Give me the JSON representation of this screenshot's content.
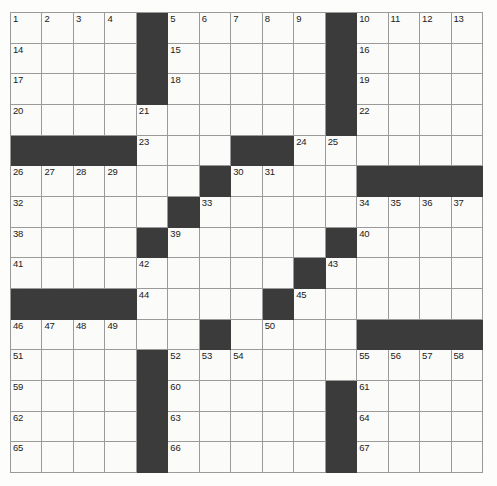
{
  "puzzle": {
    "title": "Crossword Grid",
    "size": {
      "rows": 15,
      "cols": 15
    },
    "colors": {
      "block": "#3b3b3b",
      "cell": "#fbfbf9",
      "gridline": "#9a9a9a",
      "number": "#1a1a1a",
      "page_background": "#fdfdfb"
    },
    "clue_number_count": 67,
    "block_count": 70,
    "grid": [
      [
        {
          "type": "open",
          "number": "1"
        },
        {
          "type": "open",
          "number": "2"
        },
        {
          "type": "open",
          "number": "3"
        },
        {
          "type": "open",
          "number": "4"
        },
        {
          "type": "block",
          "number": ""
        },
        {
          "type": "open",
          "number": "5"
        },
        {
          "type": "open",
          "number": "6"
        },
        {
          "type": "open",
          "number": "7"
        },
        {
          "type": "open",
          "number": "8"
        },
        {
          "type": "open",
          "number": "9"
        },
        {
          "type": "block",
          "number": ""
        },
        {
          "type": "open",
          "number": "10"
        },
        {
          "type": "open",
          "number": "11"
        },
        {
          "type": "open",
          "number": "12"
        },
        {
          "type": "open",
          "number": "13"
        }
      ],
      [
        {
          "type": "open",
          "number": "14"
        },
        {
          "type": "open",
          "number": ""
        },
        {
          "type": "open",
          "number": ""
        },
        {
          "type": "open",
          "number": ""
        },
        {
          "type": "block",
          "number": ""
        },
        {
          "type": "open",
          "number": "15"
        },
        {
          "type": "open",
          "number": ""
        },
        {
          "type": "open",
          "number": ""
        },
        {
          "type": "open",
          "number": ""
        },
        {
          "type": "open",
          "number": ""
        },
        {
          "type": "block",
          "number": ""
        },
        {
          "type": "open",
          "number": "16"
        },
        {
          "type": "open",
          "number": ""
        },
        {
          "type": "open",
          "number": ""
        },
        {
          "type": "open",
          "number": ""
        }
      ],
      [
        {
          "type": "open",
          "number": "17"
        },
        {
          "type": "open",
          "number": ""
        },
        {
          "type": "open",
          "number": ""
        },
        {
          "type": "open",
          "number": ""
        },
        {
          "type": "block",
          "number": ""
        },
        {
          "type": "open",
          "number": "18"
        },
        {
          "type": "open",
          "number": ""
        },
        {
          "type": "open",
          "number": ""
        },
        {
          "type": "open",
          "number": ""
        },
        {
          "type": "open",
          "number": ""
        },
        {
          "type": "block",
          "number": ""
        },
        {
          "type": "open",
          "number": "19"
        },
        {
          "type": "open",
          "number": ""
        },
        {
          "type": "open",
          "number": ""
        },
        {
          "type": "open",
          "number": ""
        }
      ],
      [
        {
          "type": "open",
          "number": "20"
        },
        {
          "type": "open",
          "number": ""
        },
        {
          "type": "open",
          "number": ""
        },
        {
          "type": "open",
          "number": ""
        },
        {
          "type": "open",
          "number": "21"
        },
        {
          "type": "open",
          "number": ""
        },
        {
          "type": "open",
          "number": ""
        },
        {
          "type": "open",
          "number": ""
        },
        {
          "type": "open",
          "number": ""
        },
        {
          "type": "open",
          "number": ""
        },
        {
          "type": "block",
          "number": ""
        },
        {
          "type": "open",
          "number": "22"
        },
        {
          "type": "open",
          "number": ""
        },
        {
          "type": "open",
          "number": ""
        },
        {
          "type": "open",
          "number": ""
        }
      ],
      [
        {
          "type": "block",
          "number": ""
        },
        {
          "type": "block",
          "number": ""
        },
        {
          "type": "block",
          "number": ""
        },
        {
          "type": "block",
          "number": ""
        },
        {
          "type": "open",
          "number": "23"
        },
        {
          "type": "open",
          "number": ""
        },
        {
          "type": "open",
          "number": ""
        },
        {
          "type": "block",
          "number": ""
        },
        {
          "type": "block",
          "number": ""
        },
        {
          "type": "open",
          "number": "24"
        },
        {
          "type": "open",
          "number": "25"
        },
        {
          "type": "open",
          "number": ""
        },
        {
          "type": "open",
          "number": ""
        },
        {
          "type": "open",
          "number": ""
        },
        {
          "type": "open",
          "number": ""
        }
      ],
      [
        {
          "type": "open",
          "number": "26"
        },
        {
          "type": "open",
          "number": "27"
        },
        {
          "type": "open",
          "number": "28"
        },
        {
          "type": "open",
          "number": "29"
        },
        {
          "type": "open",
          "number": ""
        },
        {
          "type": "open",
          "number": ""
        },
        {
          "type": "block",
          "number": ""
        },
        {
          "type": "open",
          "number": "30"
        },
        {
          "type": "open",
          "number": "31"
        },
        {
          "type": "open",
          "number": ""
        },
        {
          "type": "open",
          "number": ""
        },
        {
          "type": "block",
          "number": ""
        },
        {
          "type": "block",
          "number": ""
        },
        {
          "type": "block",
          "number": ""
        },
        {
          "type": "block",
          "number": ""
        }
      ],
      [
        {
          "type": "open",
          "number": "32"
        },
        {
          "type": "open",
          "number": ""
        },
        {
          "type": "open",
          "number": ""
        },
        {
          "type": "open",
          "number": ""
        },
        {
          "type": "open",
          "number": ""
        },
        {
          "type": "block",
          "number": ""
        },
        {
          "type": "open",
          "number": "33"
        },
        {
          "type": "open",
          "number": ""
        },
        {
          "type": "open",
          "number": ""
        },
        {
          "type": "open",
          "number": ""
        },
        {
          "type": "open",
          "number": ""
        },
        {
          "type": "open",
          "number": "34"
        },
        {
          "type": "open",
          "number": "35"
        },
        {
          "type": "open",
          "number": "36"
        },
        {
          "type": "open",
          "number": "37"
        }
      ],
      [
        {
          "type": "open",
          "number": "38"
        },
        {
          "type": "open",
          "number": ""
        },
        {
          "type": "open",
          "number": ""
        },
        {
          "type": "open",
          "number": ""
        },
        {
          "type": "block",
          "number": ""
        },
        {
          "type": "open",
          "number": "39"
        },
        {
          "type": "open",
          "number": ""
        },
        {
          "type": "open",
          "number": ""
        },
        {
          "type": "open",
          "number": ""
        },
        {
          "type": "open",
          "number": ""
        },
        {
          "type": "block",
          "number": ""
        },
        {
          "type": "open",
          "number": "40"
        },
        {
          "type": "open",
          "number": ""
        },
        {
          "type": "open",
          "number": ""
        },
        {
          "type": "open",
          "number": ""
        }
      ],
      [
        {
          "type": "open",
          "number": "41"
        },
        {
          "type": "open",
          "number": ""
        },
        {
          "type": "open",
          "number": ""
        },
        {
          "type": "open",
          "number": ""
        },
        {
          "type": "open",
          "number": "42"
        },
        {
          "type": "open",
          "number": ""
        },
        {
          "type": "open",
          "number": ""
        },
        {
          "type": "open",
          "number": ""
        },
        {
          "type": "open",
          "number": ""
        },
        {
          "type": "block",
          "number": ""
        },
        {
          "type": "open",
          "number": "43"
        },
        {
          "type": "open",
          "number": ""
        },
        {
          "type": "open",
          "number": ""
        },
        {
          "type": "open",
          "number": ""
        },
        {
          "type": "open",
          "number": ""
        }
      ],
      [
        {
          "type": "block",
          "number": ""
        },
        {
          "type": "block",
          "number": ""
        },
        {
          "type": "block",
          "number": ""
        },
        {
          "type": "block",
          "number": ""
        },
        {
          "type": "open",
          "number": "44"
        },
        {
          "type": "open",
          "number": ""
        },
        {
          "type": "open",
          "number": ""
        },
        {
          "type": "open",
          "number": ""
        },
        {
          "type": "block",
          "number": ""
        },
        {
          "type": "open",
          "number": "45"
        },
        {
          "type": "open",
          "number": ""
        },
        {
          "type": "open",
          "number": ""
        },
        {
          "type": "open",
          "number": ""
        },
        {
          "type": "open",
          "number": ""
        },
        {
          "type": "open",
          "number": ""
        }
      ],
      [
        {
          "type": "open",
          "number": "46"
        },
        {
          "type": "open",
          "number": "47"
        },
        {
          "type": "open",
          "number": "48"
        },
        {
          "type": "open",
          "number": "49"
        },
        {
          "type": "open",
          "number": ""
        },
        {
          "type": "open",
          "number": ""
        },
        {
          "type": "block",
          "number": ""
        },
        {
          "type": "open",
          "number": ""
        },
        {
          "type": "open",
          "number": "50"
        },
        {
          "type": "open",
          "number": ""
        },
        {
          "type": "open",
          "number": ""
        },
        {
          "type": "block",
          "number": ""
        },
        {
          "type": "block",
          "number": ""
        },
        {
          "type": "block",
          "number": ""
        },
        {
          "type": "block",
          "number": ""
        }
      ],
      [
        {
          "type": "open",
          "number": "51"
        },
        {
          "type": "open",
          "number": ""
        },
        {
          "type": "open",
          "number": ""
        },
        {
          "type": "open",
          "number": ""
        },
        {
          "type": "block",
          "number": ""
        },
        {
          "type": "open",
          "number": "52"
        },
        {
          "type": "open",
          "number": "53"
        },
        {
          "type": "open",
          "number": "54"
        },
        {
          "type": "open",
          "number": ""
        },
        {
          "type": "open",
          "number": ""
        },
        {
          "type": "open",
          "number": ""
        },
        {
          "type": "open",
          "number": "55"
        },
        {
          "type": "open",
          "number": "56"
        },
        {
          "type": "open",
          "number": "57"
        },
        {
          "type": "open",
          "number": "58"
        }
      ],
      [
        {
          "type": "open",
          "number": "59"
        },
        {
          "type": "open",
          "number": ""
        },
        {
          "type": "open",
          "number": ""
        },
        {
          "type": "open",
          "number": ""
        },
        {
          "type": "block",
          "number": ""
        },
        {
          "type": "open",
          "number": "60"
        },
        {
          "type": "open",
          "number": ""
        },
        {
          "type": "open",
          "number": ""
        },
        {
          "type": "open",
          "number": ""
        },
        {
          "type": "open",
          "number": ""
        },
        {
          "type": "block",
          "number": ""
        },
        {
          "type": "open",
          "number": "61"
        },
        {
          "type": "open",
          "number": ""
        },
        {
          "type": "open",
          "number": ""
        },
        {
          "type": "open",
          "number": ""
        }
      ],
      [
        {
          "type": "open",
          "number": "62"
        },
        {
          "type": "open",
          "number": ""
        },
        {
          "type": "open",
          "number": ""
        },
        {
          "type": "open",
          "number": ""
        },
        {
          "type": "block",
          "number": ""
        },
        {
          "type": "open",
          "number": "63"
        },
        {
          "type": "open",
          "number": ""
        },
        {
          "type": "open",
          "number": ""
        },
        {
          "type": "open",
          "number": ""
        },
        {
          "type": "open",
          "number": ""
        },
        {
          "type": "block",
          "number": ""
        },
        {
          "type": "open",
          "number": "64"
        },
        {
          "type": "open",
          "number": ""
        },
        {
          "type": "open",
          "number": ""
        },
        {
          "type": "open",
          "number": ""
        }
      ],
      [
        {
          "type": "open",
          "number": "65"
        },
        {
          "type": "open",
          "number": ""
        },
        {
          "type": "open",
          "number": ""
        },
        {
          "type": "open",
          "number": ""
        },
        {
          "type": "block",
          "number": ""
        },
        {
          "type": "open",
          "number": "66"
        },
        {
          "type": "open",
          "number": ""
        },
        {
          "type": "open",
          "number": ""
        },
        {
          "type": "open",
          "number": ""
        },
        {
          "type": "open",
          "number": ""
        },
        {
          "type": "block",
          "number": ""
        },
        {
          "type": "open",
          "number": "67"
        },
        {
          "type": "open",
          "number": ""
        },
        {
          "type": "open",
          "number": ""
        },
        {
          "type": "open",
          "number": ""
        }
      ]
    ]
  }
}
